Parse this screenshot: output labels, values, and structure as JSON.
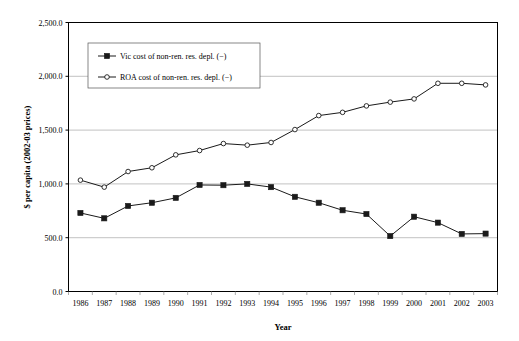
{
  "chart_data": {
    "type": "line",
    "title": "",
    "xlabel": "Year",
    "ylabel": "$ per capita (2002-03 prices)",
    "categories": [
      "1986",
      "1987",
      "1988",
      "1989",
      "1990",
      "1991",
      "1992",
      "1993",
      "1994",
      "1995",
      "1996",
      "1997",
      "1998",
      "1999",
      "2000",
      "2001",
      "2002",
      "2003"
    ],
    "ylim": [
      0,
      2500
    ],
    "ytick_labels": [
      "0.0",
      "500.0",
      "1,000.0",
      "1,500.0",
      "2,000.0",
      "2,500.0"
    ],
    "ytick_values": [
      0,
      500,
      1000,
      1500,
      2000,
      2500
    ],
    "grid": true,
    "legend_position": "upper-left-inside",
    "series": [
      {
        "name": "Vic cost of non-ren. res. depl. (−)",
        "marker": "filled-square",
        "color": "#1a1a1a",
        "values": [
          730,
          680,
          795,
          825,
          870,
          990,
          988,
          1000,
          970,
          880,
          825,
          755,
          720,
          515,
          695,
          640,
          535,
          538
        ]
      },
      {
        "name": "ROA cost of non-ren. res. depl. (−)",
        "marker": "open-circle",
        "color": "#1a1a1a",
        "values": [
          1035,
          970,
          1115,
          1150,
          1270,
          1310,
          1375,
          1360,
          1385,
          1505,
          1635,
          1665,
          1725,
          1760,
          1790,
          1935,
          1935,
          1920
        ]
      }
    ]
  },
  "legend": {
    "entries": [
      {
        "label": "Vic cost of non-ren. res. depl. (−)"
      },
      {
        "label": "ROA cost of non-ren. res. depl. (−)"
      }
    ]
  },
  "axes": {
    "x_title": "Year",
    "y_title": "$ per capita (2002-03 prices)"
  }
}
